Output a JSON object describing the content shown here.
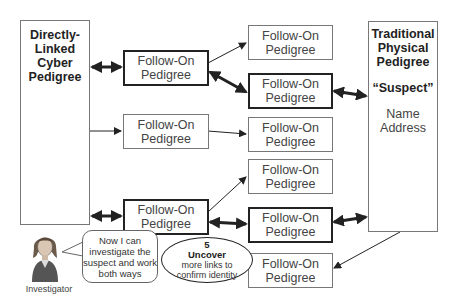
{
  "left_box": {
    "lines": [
      "Directly-",
      "Linked",
      "Cyber",
      "Pedigree"
    ]
  },
  "right_box": {
    "title_lines": [
      "Traditional",
      "Physical",
      "Pedigree"
    ],
    "suspect": "“Suspect”",
    "fields": [
      "Name",
      "Address"
    ]
  },
  "middle_boxes": [
    {
      "line1": "Follow-On",
      "line2": "Pedigree",
      "bold": true
    },
    {
      "line1": "Follow-On",
      "line2": "Pedigree",
      "bold": false
    },
    {
      "line1": "Follow-On",
      "line2": "Pedigree",
      "bold": true
    }
  ],
  "right_column_boxes": [
    {
      "line1": "Follow-On",
      "line2": "Pedigree",
      "bold": false
    },
    {
      "line1": "Follow-On",
      "line2": "Pedigree",
      "bold": true
    },
    {
      "line1": "Follow-On",
      "line2": "Pedigree",
      "bold": false
    },
    {
      "line1": "Follow-On",
      "line2": "Pedigree",
      "bold": false
    },
    {
      "line1": "Follow-On",
      "line2": "Pedigree",
      "bold": true
    },
    {
      "line1": "Follow-On",
      "line2": "Pedigree",
      "bold": false
    }
  ],
  "speech_bubble": {
    "lines": [
      "Now I can",
      "investigate the",
      "suspect and work",
      "both ways"
    ]
  },
  "step": {
    "number": "5",
    "title": "Uncover",
    "lines": [
      "more links to",
      "confirm identity"
    ]
  },
  "investigator_label": "Investigator"
}
